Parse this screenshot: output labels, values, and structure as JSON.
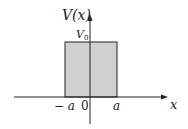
{
  "diagram": {
    "y_axis_label": "V(x)",
    "x_axis_label": "x",
    "height_label": "V",
    "height_subscript": "0",
    "tick_labels": {
      "neg_a": "− a",
      "zero": "0",
      "pos_a": "a"
    },
    "colors": {
      "fill": "#d0d0d0",
      "stroke": "#222222"
    }
  }
}
